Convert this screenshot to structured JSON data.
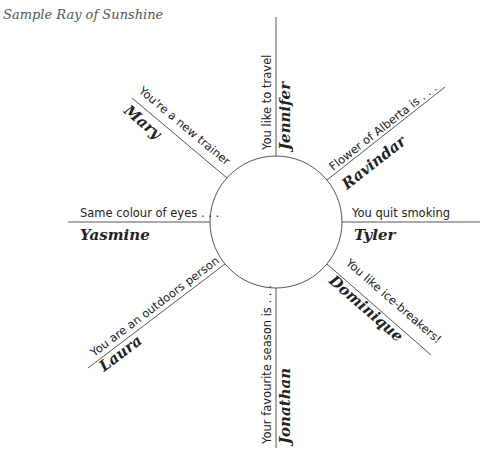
{
  "title": "Sample Ray of Sunshine",
  "diagram": {
    "center": {
      "x": 276,
      "y": 222
    },
    "radius": 66,
    "line_color": "#555555",
    "rays": [
      {
        "id": "top",
        "prompt": "You like to travel",
        "name": "Jennifer"
      },
      {
        "id": "upper-right",
        "prompt": "Flower of Alberta is . . .",
        "name": "Ravindar"
      },
      {
        "id": "right",
        "prompt": "You quit smoking",
        "name": "Tyler"
      },
      {
        "id": "lower-right",
        "prompt": "You like ice-breakers!",
        "name": "Dominique"
      },
      {
        "id": "bottom",
        "prompt": "Your favourite season is . . .",
        "name": "Jonathan"
      },
      {
        "id": "lower-left",
        "prompt": "You are an outdoors person",
        "name": "Laura"
      },
      {
        "id": "left",
        "prompt": "Same colour of eyes . . .",
        "name": "Yasmine"
      },
      {
        "id": "upper-left",
        "prompt": "You're a new trainer",
        "name": "Mary"
      }
    ]
  }
}
